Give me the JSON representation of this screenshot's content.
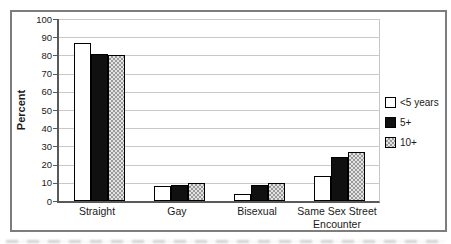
{
  "chart_data": {
    "type": "bar",
    "title": "",
    "ylabel": "Percent",
    "xlabel": "",
    "ylim": [
      0,
      100
    ],
    "ytick_step": 10,
    "y_tick_labels": [
      "100",
      "90",
      "80",
      "70",
      "60",
      "50",
      "40",
      "30",
      "20",
      "10",
      "0"
    ],
    "grid": true,
    "legend_position": "right",
    "categories": [
      "Straight",
      "Gay",
      "Bisexual",
      "Same Sex Street Encounter"
    ],
    "series": [
      {
        "name": "<5 years",
        "fill": "white",
        "values": [
          87,
          8,
          4,
          14
        ]
      },
      {
        "name": "5+",
        "fill": "black",
        "values": [
          81,
          9,
          9,
          24
        ]
      },
      {
        "name": "10+",
        "fill": "checker",
        "values": [
          80,
          10,
          10,
          27
        ]
      }
    ],
    "colors": {
      "frame_border": "#7d7d7d",
      "axis": "#595959",
      "gridline": "#c9c9c9",
      "bar_white": "#ffffff",
      "bar_black": "#101010",
      "bar_checker_dark": "#9a9a9a",
      "bar_checker_light": "#e3e3e3",
      "text": "#1a1a1a"
    }
  }
}
